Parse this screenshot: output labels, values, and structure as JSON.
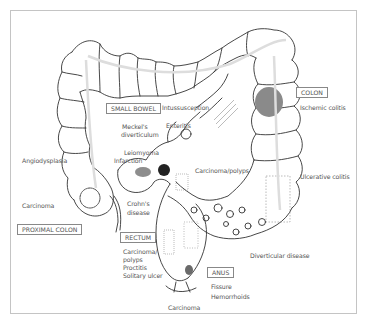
{
  "diagram": {
    "type": "anatomical illustration",
    "regions": [
      {
        "id": "small_bowel",
        "label": "SMALL BOWEL"
      },
      {
        "id": "colon",
        "label": "COLON"
      },
      {
        "id": "proximal_colon",
        "label": "PROXIMAL COLON"
      },
      {
        "id": "rectum",
        "label": "RECTUM"
      },
      {
        "id": "anus",
        "label": "ANUS"
      }
    ],
    "labels": {
      "intussusception": "Intussusception",
      "enteritis": "Enteritis",
      "meckels_1": "Meckel's",
      "meckels_2": "diverticulum",
      "leiomyoma": "Leiomyoma",
      "infarction": "Infarction",
      "angiodysplasia": "Angiodysplasia",
      "carcinoma_proximal": "Carcinoma",
      "crohns_1": "Crohn's",
      "crohns_2": "disease",
      "carcinoma_polyps": "Carcinoma/polyps",
      "ischemic_colitis": "Ischemic colitis",
      "ulcerative_colitis": "Ulcerative colitis",
      "diverticular_disease": "Diverticular disease",
      "rectum_carcinoma_1": "Carcinoma/",
      "rectum_carcinoma_2": "polyps",
      "proctitis": "Proctitis",
      "solitary_ulcer": "Solitary ulcer",
      "fissure": "Fissure",
      "hemorrhoids": "Hemorrhoids",
      "carcinoma_anal": "Carcinoma"
    }
  }
}
